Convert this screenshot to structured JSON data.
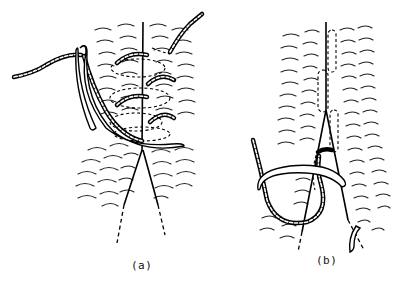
{
  "figure": {
    "panels": [
      {
        "id": "a",
        "label": "(a)",
        "content": "Curved needle with twisted thread passing through both wound edges in a continuous spiral (over-and-over) stitch; hidden thread path shown dashed"
      },
      {
        "id": "b",
        "label": "(b)",
        "content": "Curved needle passing beneath the thread loop along the wound edge; subcuticular thread path shown dashed"
      }
    ]
  }
}
